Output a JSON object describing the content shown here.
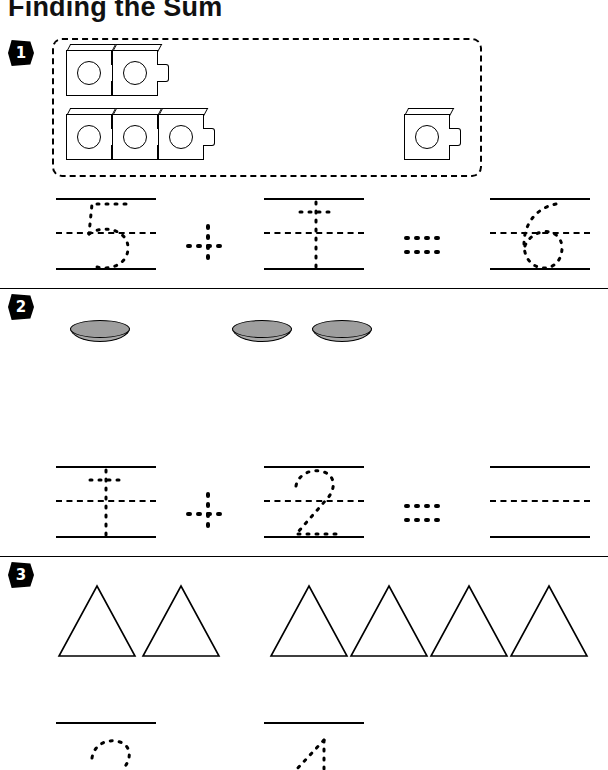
{
  "worksheet": {
    "title": "Finding the Sum",
    "dot_color": "#000000",
    "coin_color": "#9e9e9e"
  },
  "problems": [
    {
      "number": "1",
      "badge_name": "problem-number-1",
      "manipulative": "linking-cubes",
      "group_a_count": 5,
      "group_b_count": 1,
      "equation": {
        "addend_1": "5",
        "operator": "+",
        "addend_2": "1",
        "equals": "=",
        "sum": "6",
        "addend_1_style": "traced-dotted",
        "addend_2_style": "traced-dotted",
        "sum_style": "traced-dotted"
      }
    },
    {
      "number": "2",
      "badge_name": "problem-number-2",
      "manipulative": "coins",
      "group_a_count": 1,
      "group_b_count": 2,
      "equation": {
        "addend_1": "1",
        "operator": "+",
        "addend_2": "2",
        "equals": "=",
        "sum": "",
        "addend_1_style": "traced-dotted",
        "addend_2_style": "traced-dotted",
        "sum_style": "blank"
      }
    },
    {
      "number": "3",
      "badge_name": "problem-number-3",
      "manipulative": "triangles",
      "group_a_count": 2,
      "group_b_count": 4,
      "equation": {
        "addend_1": "2",
        "operator": "+",
        "addend_2": "4",
        "equals": "=",
        "sum": "",
        "addend_1_style": "dotted-partial",
        "addend_2_style": "dotted-partial",
        "sum_style": "blank"
      }
    }
  ]
}
